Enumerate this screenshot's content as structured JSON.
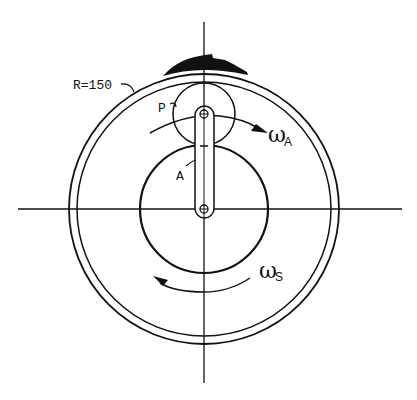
{
  "diagram": {
    "type": "planetary-gear-mechanism",
    "labels": {
      "ring_radius": "R=150",
      "planet": "P",
      "arm": "A",
      "omega_arm_symbol": "ω",
      "omega_arm_subscript": "A",
      "omega_sun_symbol": "ω",
      "omega_sun_subscript": "S"
    },
    "components": [
      {
        "id": "ring-gear",
        "description": "outer ring gear, two concentric circles",
        "labelled_radius": "R=150"
      },
      {
        "id": "sun-gear",
        "description": "central sun gear"
      },
      {
        "id": "planet-gear",
        "label": "P",
        "description": "planet gear meshing between sun and ring"
      },
      {
        "id": "arm",
        "label": "A",
        "description": "carrier arm joining sun center to planet center"
      },
      {
        "id": "contact-patch",
        "description": "shaded region on top of ring"
      }
    ],
    "arrows": [
      {
        "id": "arm-rotation",
        "label": "ωA",
        "direction": "clockwise"
      },
      {
        "id": "sun-rotation",
        "label": "ωS",
        "direction": "counterclockwise"
      }
    ],
    "colors": {
      "stroke": "#111111",
      "background": "#ffffff"
    }
  }
}
